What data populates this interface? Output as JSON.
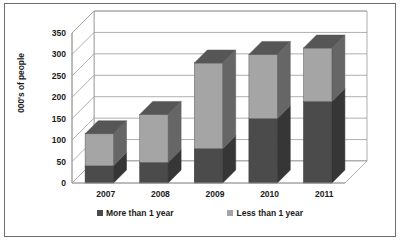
{
  "chart_data": {
    "type": "bar",
    "subtype": "stacked-3d-column",
    "title": "",
    "xlabel": "",
    "ylabel": "000's of people",
    "categories": [
      "2007",
      "2008",
      "2009",
      "2010",
      "2011"
    ],
    "series": [
      {
        "name": "More than 1 year",
        "color": "#4b4b4b",
        "values": [
          40,
          48,
          80,
          150,
          190
        ]
      },
      {
        "name": "Less than 1 year",
        "color": "#a5a5a5",
        "values": [
          75,
          112,
          200,
          150,
          125
        ]
      }
    ],
    "totals": [
      115,
      160,
      280,
      300,
      315
    ],
    "ylim": [
      0,
      350
    ],
    "yticks": [
      "0",
      "50",
      "100",
      "150",
      "200",
      "250",
      "300",
      "350"
    ],
    "ytick_values": [
      0,
      50,
      100,
      150,
      200,
      250,
      300,
      350
    ],
    "grid": true,
    "legend_position": "bottom"
  },
  "legend": {
    "items": [
      {
        "label": "More than 1 year",
        "color": "#4b4b4b"
      },
      {
        "label": "Less than 1 year",
        "color": "#a5a5a5"
      }
    ]
  },
  "colors": {
    "series_dark": "#4b4b4b",
    "series_light": "#a5a5a5",
    "frame_border": "#6b6b6b",
    "gridline": "#9a9a9a",
    "text": "#1a1a1a",
    "background": "#ffffff"
  }
}
